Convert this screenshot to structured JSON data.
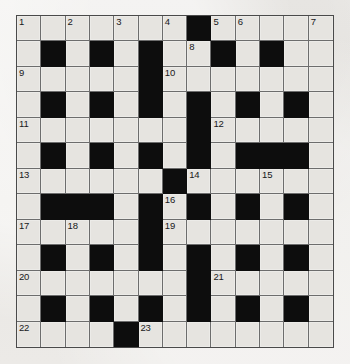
{
  "puzzle": {
    "type": "crossword-grid",
    "title": "Crossword Puzzle Grid",
    "rows": 13,
    "columns": 13,
    "colors": {
      "page_background": "#eceae6",
      "white_cell": "#e6e4e0",
      "black_cell": "#0d0d0d",
      "grid_line": "#6d6d6d",
      "border": "#4a4a4a",
      "number_text": "#18181a"
    },
    "legend": {
      "white": "open letter square",
      "black": "blocked square"
    },
    "grid": [
      [
        "W",
        "W",
        "W",
        "W",
        "W",
        "W",
        "W",
        "B",
        "W",
        "W",
        "W",
        "W",
        "W"
      ],
      [
        "W",
        "B",
        "W",
        "B",
        "W",
        "B",
        "W",
        "W",
        "B",
        "W",
        "B",
        "W",
        "W"
      ],
      [
        "W",
        "W",
        "W",
        "W",
        "W",
        "B",
        "W",
        "W",
        "W",
        "W",
        "W",
        "W",
        "W"
      ],
      [
        "W",
        "B",
        "W",
        "B",
        "W",
        "B",
        "W",
        "B",
        "W",
        "B",
        "W",
        "B",
        "W"
      ],
      [
        "W",
        "W",
        "W",
        "W",
        "W",
        "W",
        "W",
        "B",
        "W",
        "W",
        "W",
        "W",
        "W"
      ],
      [
        "W",
        "B",
        "W",
        "B",
        "W",
        "B",
        "W",
        "B",
        "W",
        "B",
        "B",
        "B",
        "W"
      ],
      [
        "W",
        "W",
        "W",
        "W",
        "W",
        "W",
        "B",
        "W",
        "W",
        "W",
        "W",
        "W",
        "W"
      ],
      [
        "W",
        "B",
        "B",
        "B",
        "W",
        "B",
        "W",
        "B",
        "W",
        "B",
        "W",
        "B",
        "W"
      ],
      [
        "W",
        "W",
        "W",
        "W",
        "W",
        "B",
        "W",
        "W",
        "W",
        "W",
        "W",
        "W",
        "W"
      ],
      [
        "W",
        "B",
        "W",
        "B",
        "W",
        "B",
        "W",
        "B",
        "W",
        "B",
        "W",
        "B",
        "W"
      ],
      [
        "W",
        "W",
        "W",
        "W",
        "W",
        "W",
        "W",
        "B",
        "W",
        "W",
        "W",
        "W",
        "W"
      ],
      [
        "W",
        "B",
        "W",
        "B",
        "W",
        "B",
        "W",
        "B",
        "W",
        "B",
        "W",
        "B",
        "W"
      ],
      [
        "W",
        "W",
        "W",
        "W",
        "B",
        "W",
        "W",
        "W",
        "W",
        "W",
        "W",
        "W",
        "W"
      ]
    ],
    "numbers": [
      {
        "n": 1,
        "row": 0,
        "col": 0
      },
      {
        "n": 2,
        "row": 0,
        "col": 2
      },
      {
        "n": 3,
        "row": 0,
        "col": 4
      },
      {
        "n": 4,
        "row": 0,
        "col": 6
      },
      {
        "n": 5,
        "row": 0,
        "col": 8
      },
      {
        "n": 6,
        "row": 0,
        "col": 9
      },
      {
        "n": 7,
        "row": 0,
        "col": 12
      },
      {
        "n": 8,
        "row": 1,
        "col": 7
      },
      {
        "n": 9,
        "row": 2,
        "col": 0
      },
      {
        "n": 10,
        "row": 2,
        "col": 6
      },
      {
        "n": 11,
        "row": 4,
        "col": 0
      },
      {
        "n": 12,
        "row": 4,
        "col": 8
      },
      {
        "n": 13,
        "row": 6,
        "col": 0
      },
      {
        "n": 14,
        "row": 6,
        "col": 7
      },
      {
        "n": 15,
        "row": 6,
        "col": 10
      },
      {
        "n": 16,
        "row": 7,
        "col": 6
      },
      {
        "n": 17,
        "row": 8,
        "col": 0
      },
      {
        "n": 18,
        "row": 8,
        "col": 2
      },
      {
        "n": 19,
        "row": 8,
        "col": 6
      },
      {
        "n": 20,
        "row": 10,
        "col": 0
      },
      {
        "n": 21,
        "row": 10,
        "col": 8
      },
      {
        "n": 22,
        "row": 12,
        "col": 0
      },
      {
        "n": 23,
        "row": 12,
        "col": 5
      }
    ],
    "entries": [
      {
        "number": 1,
        "direction": "across",
        "row": 0,
        "col": 0,
        "length": 7
      },
      {
        "number": 5,
        "direction": "across",
        "row": 0,
        "col": 8,
        "length": 5
      },
      {
        "number": 9,
        "direction": "across",
        "row": 2,
        "col": 0,
        "length": 5
      },
      {
        "number": 10,
        "direction": "across",
        "row": 2,
        "col": 6,
        "length": 7
      },
      {
        "number": 11,
        "direction": "across",
        "row": 4,
        "col": 0,
        "length": 7
      },
      {
        "number": 12,
        "direction": "across",
        "row": 4,
        "col": 8,
        "length": 5
      },
      {
        "number": 13,
        "direction": "across",
        "row": 6,
        "col": 0,
        "length": 6
      },
      {
        "number": 14,
        "direction": "across",
        "row": 6,
        "col": 7,
        "length": 6
      },
      {
        "number": 17,
        "direction": "across",
        "row": 8,
        "col": 0,
        "length": 5
      },
      {
        "number": 19,
        "direction": "across",
        "row": 8,
        "col": 6,
        "length": 7
      },
      {
        "number": 20,
        "direction": "across",
        "row": 10,
        "col": 0,
        "length": 7
      },
      {
        "number": 21,
        "direction": "across",
        "row": 10,
        "col": 8,
        "length": 5
      },
      {
        "number": 22,
        "direction": "across",
        "row": 12,
        "col": 0,
        "length": 4
      },
      {
        "number": 23,
        "direction": "across",
        "row": 12,
        "col": 5,
        "length": 8
      },
      {
        "number": 1,
        "direction": "down",
        "row": 0,
        "col": 0,
        "length": 13
      },
      {
        "number": 2,
        "direction": "down",
        "row": 0,
        "col": 2,
        "length": 13
      },
      {
        "number": 3,
        "direction": "down",
        "row": 0,
        "col": 4,
        "length": 13
      },
      {
        "number": 4,
        "direction": "down",
        "row": 0,
        "col": 6,
        "length": 6
      },
      {
        "number": 5,
        "direction": "down",
        "row": 0,
        "col": 8,
        "length": 13
      },
      {
        "number": 6,
        "direction": "down",
        "row": 0,
        "col": 9,
        "length": 3
      },
      {
        "number": 7,
        "direction": "down",
        "row": 0,
        "col": 12,
        "length": 13
      },
      {
        "number": 8,
        "direction": "down",
        "row": 1,
        "col": 7,
        "length": 2
      },
      {
        "number": 15,
        "direction": "down",
        "row": 6,
        "col": 10,
        "length": 7
      },
      {
        "number": 16,
        "direction": "down",
        "row": 7,
        "col": 6,
        "length": 6
      },
      {
        "number": 18,
        "direction": "down",
        "row": 8,
        "col": 2,
        "length": 5
      }
    ]
  }
}
